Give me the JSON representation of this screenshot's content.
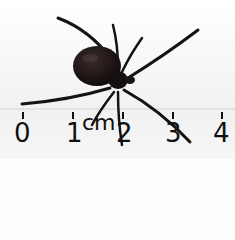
{
  "image": {
    "subject": "spider",
    "background_color": "#f4f4f4",
    "body_color": "#1a1414"
  },
  "ruler": {
    "unit": "cm",
    "labels": [
      "0",
      "1",
      "2",
      "3",
      "4"
    ],
    "label_x": [
      14,
      66,
      116,
      165,
      213
    ]
  }
}
